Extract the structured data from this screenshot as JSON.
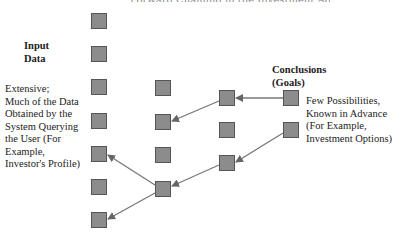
{
  "title_partial": "Forward Chaining in the Investment Advisor",
  "input_label": {
    "line1": "Input",
    "line2": "Data"
  },
  "input_desc": [
    "Extensive;",
    "Much of the Data",
    "Obtained by the",
    "System Querying",
    "the User (For",
    "Example,",
    "Investor's Profile)"
  ],
  "conclusion_label": {
    "line1": "Conclusions",
    "line2": "(Goals)"
  },
  "conclusion_desc": [
    "Few Possibilities,",
    "Known in Advance",
    "(For Example,",
    "Investment Options)"
  ],
  "colors": {
    "box_fill": "#8c8c8c",
    "box_border": "#555555",
    "arrow": "#666666"
  },
  "nodes": {
    "col1": [
      13,
      46,
      79,
      113,
      146,
      179,
      212
    ],
    "col2": [
      79,
      113,
      146,
      181
    ],
    "col3": [
      90,
      122,
      155
    ],
    "col4": [
      90,
      122
    ]
  }
}
